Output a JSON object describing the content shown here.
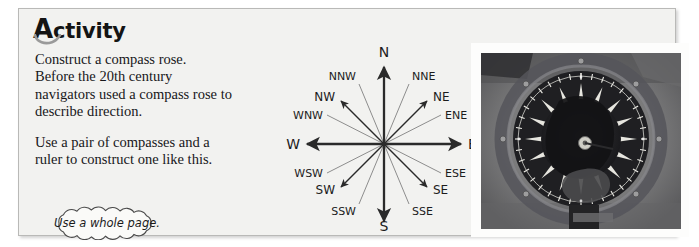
{
  "panel": {
    "heading": {
      "initial": "A",
      "rest": "ctivity",
      "full": "Activity"
    },
    "paragraphs": [
      "Construct a compass rose.",
      "Before the 20th century navigators used a compass rose to describe direction.",
      "Use a pair of compasses and a ruler to construct one like this."
    ],
    "callout": "Use a whole page."
  },
  "compass": {
    "title": "compass rose diagram",
    "cardinal": [
      {
        "label": "N",
        "bearing": 0
      },
      {
        "label": "E",
        "bearing": 90
      },
      {
        "label": "S",
        "bearing": 180
      },
      {
        "label": "W",
        "bearing": 270
      }
    ],
    "intercardinal": [
      {
        "label": "NE",
        "bearing": 45
      },
      {
        "label": "SE",
        "bearing": 135
      },
      {
        "label": "SW",
        "bearing": 225
      },
      {
        "label": "NW",
        "bearing": 315
      }
    ],
    "secondary": [
      {
        "label": "NNE",
        "bearing": 22.5
      },
      {
        "label": "ENE",
        "bearing": 67.5
      },
      {
        "label": "ESE",
        "bearing": 112.5
      },
      {
        "label": "SSE",
        "bearing": 157.5
      },
      {
        "label": "SSW",
        "bearing": 202.5
      },
      {
        "label": "WSW",
        "bearing": 247.5
      },
      {
        "label": "WNW",
        "bearing": 292.5
      },
      {
        "label": "NNW",
        "bearing": 337.5
      }
    ]
  },
  "photo": {
    "caption": "",
    "alt": "black and white photograph of a ship's magnetic compass card in its binnacle"
  },
  "colors": {
    "panel_bg": "#f2f2f0",
    "panel_border": "#b9b9b7",
    "text": "#17171a",
    "arrow_dark": "#2a2a2a",
    "leader_gray": "#8d8d8d",
    "swoosh_gray": "#9a9a9a"
  }
}
